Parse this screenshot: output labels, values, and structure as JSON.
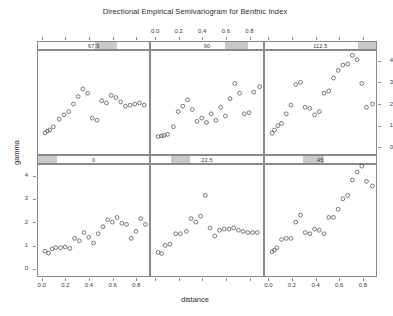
{
  "title": "Directional Empirical Semivariogram for Benthic Index",
  "axes": {
    "xlabel": "distance",
    "ylabel": "gamma",
    "xticks": [
      "0.0",
      "0.2",
      "0.4",
      "0.6",
      "0.8"
    ],
    "xtick_values": [
      0.0,
      0.2,
      0.4,
      0.6,
      0.8
    ],
    "yticks": [
      "0",
      "1",
      "2",
      "3",
      "4"
    ],
    "ytick_values": [
      0,
      1,
      2,
      3,
      4
    ],
    "xlim": [
      -0.04,
      0.92
    ],
    "ylim": [
      -0.35,
      4.5
    ]
  },
  "chart_data": {
    "type": "scatter",
    "title": "Directional Empirical Semivariogram for Benthic Index",
    "xlabel": "distance",
    "ylabel": "gamma",
    "xlim": [
      -0.04,
      0.92
    ],
    "ylim": [
      -0.35,
      4.5
    ],
    "grid": false,
    "legend": "none",
    "marker": "open-circle",
    "layout": {
      "rows": 2,
      "cols": 3,
      "strip_position": "top"
    },
    "conditioning_variable": "direction (degrees)",
    "panels": [
      {
        "strip_label": "67.5",
        "row": 1,
        "col": 1,
        "strip_fill_start": 0.5,
        "strip_fill_end": 0.7,
        "x": [
          0.02,
          0.04,
          0.06,
          0.09,
          0.14,
          0.18,
          0.22,
          0.26,
          0.3,
          0.34,
          0.38,
          0.42,
          0.46,
          0.5,
          0.54,
          0.58,
          0.62,
          0.66,
          0.7,
          0.74,
          0.78,
          0.82,
          0.86
        ],
        "y": [
          0.72,
          0.8,
          0.85,
          1.0,
          1.35,
          1.55,
          1.7,
          2.05,
          2.4,
          2.75,
          2.55,
          1.4,
          1.3,
          2.2,
          2.1,
          2.45,
          2.35,
          2.15,
          1.95,
          2.0,
          2.05,
          2.1,
          2.0
        ]
      },
      {
        "strip_label": "90",
        "row": 1,
        "col": 2,
        "strip_fill_start": 0.65,
        "strip_fill_end": 0.85,
        "x": [
          0.02,
          0.05,
          0.07,
          0.1,
          0.15,
          0.19,
          0.23,
          0.27,
          0.31,
          0.35,
          0.39,
          0.43,
          0.47,
          0.51,
          0.55,
          0.59,
          0.63,
          0.67,
          0.71,
          0.75,
          0.79,
          0.83,
          0.88
        ],
        "y": [
          0.55,
          0.58,
          0.6,
          0.65,
          1.0,
          1.7,
          1.95,
          2.25,
          1.8,
          1.25,
          1.4,
          1.2,
          1.6,
          1.3,
          1.9,
          1.5,
          2.3,
          3.0,
          2.55,
          1.6,
          1.65,
          2.6,
          2.85
        ]
      },
      {
        "strip_label": "112.5",
        "row": 1,
        "col": 3,
        "strip_fill_start": 0.82,
        "strip_fill_end": 1.0,
        "x": [
          0.02,
          0.04,
          0.07,
          0.1,
          0.14,
          0.18,
          0.22,
          0.26,
          0.3,
          0.34,
          0.38,
          0.42,
          0.46,
          0.5,
          0.54,
          0.58,
          0.62,
          0.66,
          0.7,
          0.74,
          0.78,
          0.82,
          0.87
        ],
        "y": [
          0.7,
          0.85,
          1.05,
          1.15,
          1.6,
          2.0,
          2.95,
          3.05,
          1.9,
          1.85,
          1.55,
          1.7,
          2.55,
          2.65,
          3.25,
          3.6,
          3.85,
          3.9,
          4.3,
          4.1,
          3.0,
          1.9,
          2.05
        ]
      },
      {
        "strip_label": "0",
        "row": 2,
        "col": 1,
        "strip_fill_start": 0.0,
        "strip_fill_end": 0.17,
        "x": [
          0.02,
          0.05,
          0.08,
          0.11,
          0.15,
          0.19,
          0.23,
          0.27,
          0.31,
          0.35,
          0.39,
          0.43,
          0.47,
          0.51,
          0.55,
          0.59,
          0.63,
          0.67,
          0.71,
          0.75,
          0.79,
          0.83,
          0.87
        ],
        "y": [
          0.8,
          0.72,
          0.9,
          0.95,
          0.95,
          0.98,
          0.92,
          1.35,
          1.25,
          1.6,
          1.4,
          1.15,
          1.55,
          1.85,
          2.15,
          2.05,
          2.25,
          2.0,
          1.95,
          1.35,
          1.65,
          2.2,
          1.95
        ]
      },
      {
        "strip_label": "22.5",
        "row": 2,
        "col": 2,
        "strip_fill_start": 0.17,
        "strip_fill_end": 0.34,
        "x": [
          0.02,
          0.05,
          0.08,
          0.12,
          0.17,
          0.21,
          0.26,
          0.3,
          0.34,
          0.38,
          0.42,
          0.46,
          0.5,
          0.54,
          0.58,
          0.62,
          0.66,
          0.7,
          0.74,
          0.78,
          0.82,
          0.86
        ],
        "y": [
          0.75,
          0.7,
          1.05,
          1.1,
          1.55,
          1.55,
          1.65,
          2.2,
          2.05,
          2.3,
          3.2,
          1.8,
          1.45,
          1.7,
          1.75,
          1.75,
          1.8,
          1.7,
          1.65,
          1.6,
          1.6,
          1.6
        ]
      },
      {
        "strip_label": "45",
        "row": 2,
        "col": 3,
        "strip_fill_start": 0.34,
        "strip_fill_end": 0.52,
        "x": [
          0.02,
          0.04,
          0.06,
          0.1,
          0.14,
          0.18,
          0.22,
          0.26,
          0.3,
          0.34,
          0.38,
          0.42,
          0.46,
          0.5,
          0.54,
          0.58,
          0.62,
          0.66,
          0.7,
          0.74,
          0.78,
          0.82,
          0.87
        ],
        "y": [
          0.78,
          0.85,
          0.95,
          1.3,
          1.35,
          1.35,
          2.05,
          2.35,
          1.6,
          1.55,
          1.75,
          1.7,
          1.55,
          2.25,
          2.25,
          2.6,
          3.05,
          3.2,
          3.85,
          4.2,
          4.45,
          3.8,
          3.6
        ]
      }
    ]
  }
}
